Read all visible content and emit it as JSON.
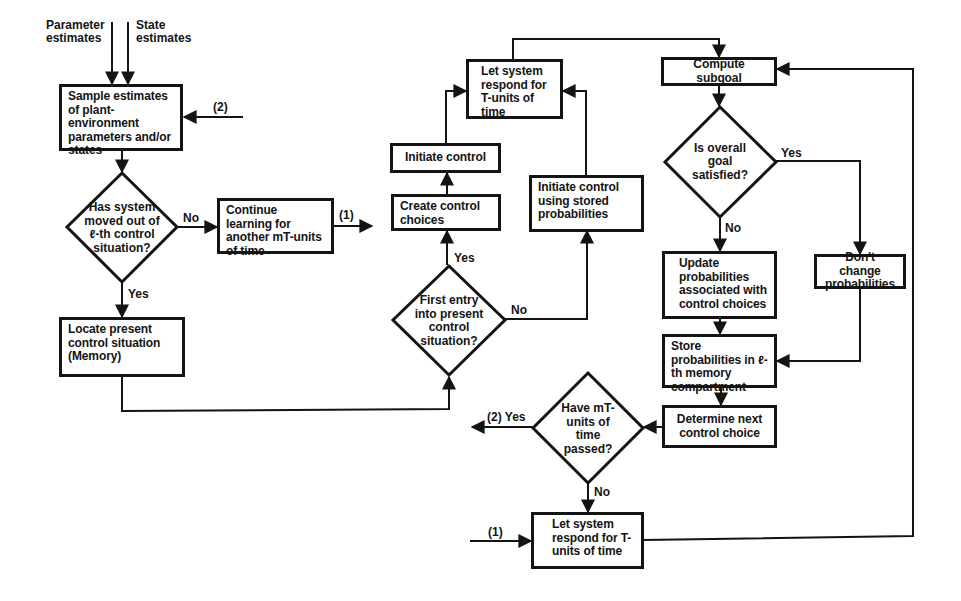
{
  "diagram": {
    "type": "flowchart",
    "inputs": {
      "parameter_estimates": "Parameter\nestimates",
      "state_estimates": "State\nestimates"
    },
    "nodes": {
      "sample": "Sample estimates of plant-environment parameters and/or states",
      "has_moved": "Has system moved out of ℓ-th control situation?",
      "continue_learning": "Continue learning for another mT-units of time",
      "locate": "Locate present control situation (Memory)",
      "first_entry": "First entry into present control situation?",
      "create_choices": "Create control choices",
      "initiate_control": "Initiate control",
      "let_respond_top": "Let system respond for T-units of time",
      "initiate_stored": "Initiate control using stored probabilities",
      "compute_subgoal": "Compute subgoal",
      "goal_satisfied": "Is overall goal satisfied?",
      "update_probs": "Update probabilities associated with control choices",
      "dont_change": "Don't change probabilities",
      "store_probs": "Store probabilities in ℓ-th memory compartment",
      "determine_next": "Determine next control choice",
      "mt_passed": "Have mT-units of time passed?",
      "let_respond_bottom": "Let system respond for T-units of time"
    },
    "labels": {
      "no": "No",
      "yes": "Yes",
      "connector_1": "(1)",
      "connector_2": "(2)",
      "connector_2_yes": "(2) Yes"
    }
  }
}
